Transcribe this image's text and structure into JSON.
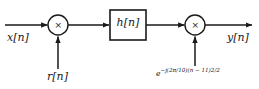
{
  "diagram": {
    "type": "signal-processing-block-diagram",
    "title": "",
    "stroke_color": "#1a1a1a",
    "background_color": "#ffffff",
    "nodes": [
      {
        "id": "input",
        "kind": "signal-label",
        "label": "x[n]",
        "x": 7,
        "y": 32
      },
      {
        "id": "mult1",
        "kind": "multiplier",
        "label": "×",
        "cx": 58,
        "cy": 25,
        "r": 10
      },
      {
        "id": "r-input",
        "kind": "signal-label",
        "label": "r[n]",
        "x": 47,
        "y": 71
      },
      {
        "id": "filter",
        "kind": "filter-block",
        "label": "h[n]",
        "x": 110,
        "y": 10,
        "w": 36,
        "h": 30
      },
      {
        "id": "mult2",
        "kind": "multiplier",
        "label": "×",
        "cx": 195,
        "cy": 25,
        "r": 10
      },
      {
        "id": "chirp",
        "kind": "signal-label",
        "label_prefix": "e",
        "label_exponent": "−j(2π/10)(n − 11)",
        "label_exponent_sup": "2",
        "label_exponent_tail": "/2",
        "x": 156,
        "y": 68
      },
      {
        "id": "output",
        "kind": "signal-label",
        "label": "y[n]",
        "x": 227,
        "y": 32
      }
    ],
    "edges": [
      {
        "from": "input",
        "to": "mult1",
        "orientation": "horizontal",
        "arrow": true
      },
      {
        "from": "r-input",
        "to": "mult1",
        "orientation": "vertical",
        "arrow": true
      },
      {
        "from": "mult1",
        "to": "filter",
        "orientation": "horizontal",
        "arrow": true
      },
      {
        "from": "filter",
        "to": "mult2",
        "orientation": "horizontal",
        "arrow": true
      },
      {
        "from": "chirp",
        "to": "mult2",
        "orientation": "vertical",
        "arrow": true
      },
      {
        "from": "mult2",
        "to": "output",
        "orientation": "horizontal",
        "arrow": true
      }
    ],
    "labels": {
      "input_signal": "x[n]",
      "noise_signal": "r[n]",
      "filter_impulse_response": "h[n]",
      "output_signal": "y[n]",
      "multiplier_symbol": "×",
      "chirp_base": "e",
      "chirp_exponent": "−j(2π/10)(n − 11)",
      "chirp_exponent_power": "2",
      "chirp_exponent_tail": "/2"
    }
  }
}
